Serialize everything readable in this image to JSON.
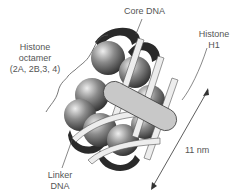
{
  "labels": {
    "core_dna": "Core DNA",
    "histone_octamer": [
      "Histone",
      "octamer",
      "(2A, 2B,3, 4)"
    ],
    "histone_h1": [
      "Histone",
      "H1"
    ],
    "linker_dna": [
      "Linker",
      "DNA"
    ],
    "dimension": "11 nm"
  },
  "colors": {
    "histone_sphere": "#6e6e6e",
    "dna_ribbon_light": "#ededed",
    "dna_ribbon_dark": "#2a2a2a",
    "h1_fill": "#c8c8c8",
    "label_text": "#555555"
  }
}
